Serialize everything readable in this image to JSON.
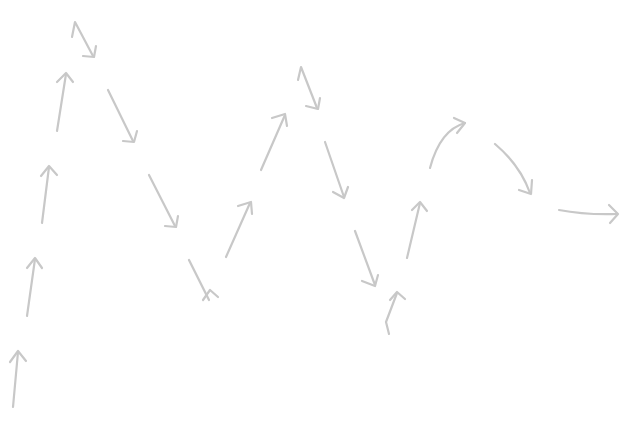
{
  "diagram": {
    "title": "",
    "background": "#ffffff",
    "stroke_color": "#c8c8c8",
    "stroke_width": 2.2,
    "arrows": [
      {
        "id": "a1",
        "direction": "up",
        "shape": "straight",
        "d": "M13,407 L18,352",
        "head": "M10,362 L18,351 L26,361"
      },
      {
        "id": "a2",
        "direction": "up",
        "shape": "straight",
        "d": "M27,316 L35,259",
        "head": "M27,268 L35,258 L42,268"
      },
      {
        "id": "a3",
        "direction": "up",
        "shape": "straight",
        "d": "M42,223 L49,167",
        "head": "M41,176 L49,166 L57,175"
      },
      {
        "id": "a4",
        "direction": "up",
        "shape": "straight",
        "d": "M57,131 L66,74",
        "head": "M57,82 L66,73 L73,82"
      },
      {
        "id": "a5",
        "direction": "down-right",
        "shape": "zigzag",
        "d": "M72,37 L75,22 L93,56",
        "head": "M83,56 L94,57 L96,46"
      },
      {
        "id": "a6",
        "direction": "down-right",
        "shape": "straight",
        "d": "M108,90 L133,141",
        "head": "M123,141 L134,142 L137,131"
      },
      {
        "id": "a7",
        "direction": "down-right",
        "shape": "straight",
        "d": "M149,175 L175,226",
        "head": "M165,226 L176,227 L178,216"
      },
      {
        "id": "a8",
        "direction": "down-right",
        "shape": "hooked",
        "d": "M189,260 L209,300",
        "head": "M203,300 L210,290 L218,297"
      },
      {
        "id": "a9",
        "direction": "up-right",
        "shape": "straight",
        "d": "M226,257 L250,203",
        "head": "M238,206 L251,202 L252,214"
      },
      {
        "id": "a10",
        "direction": "up-right",
        "shape": "straight",
        "d": "M261,170 L285,115",
        "head": "M272,118 L285,114 L287,126"
      },
      {
        "id": "a11",
        "direction": "down-right",
        "shape": "zigzag",
        "d": "M298,80 L301,67 L317,108",
        "head": "M306,106 L318,109 L320,98"
      },
      {
        "id": "a12",
        "direction": "down",
        "shape": "straight",
        "d": "M325,142 L344,197",
        "head": "M333,192 L344,198 L348,187"
      },
      {
        "id": "a13",
        "direction": "down",
        "shape": "straight",
        "d": "M355,231 L375,285",
        "head": "M362,281 L375,286 L378,275"
      },
      {
        "id": "a14",
        "direction": "up",
        "shape": "zigzag",
        "d": "M389,334 L386,322 L397,293",
        "head": "M390,300 L397,292 L405,299"
      },
      {
        "id": "a15",
        "direction": "up",
        "shape": "straight",
        "d": "M407,258 L420,203",
        "head": "M412,210 L420,202 L427,211"
      },
      {
        "id": "a16",
        "direction": "up-right",
        "shape": "curved",
        "d": "M430,168 Q440,130 465,123",
        "head": "M454,118 L465,123 L457,133"
      },
      {
        "id": "a17",
        "direction": "down-right",
        "shape": "curved",
        "d": "M495,144 Q520,165 530,193",
        "head": "M519,190 L531,194 L532,180"
      },
      {
        "id": "a18",
        "direction": "right",
        "shape": "curved",
        "d": "M559,210 Q585,215 617,214",
        "head": "M609,205 L618,214 L610,223"
      }
    ]
  }
}
